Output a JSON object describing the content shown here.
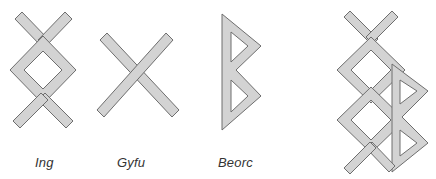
{
  "diagram": {
    "fill_color": "#d3d3d3",
    "stroke_color": "#6e6e6e",
    "label_color": "#333333",
    "runes": [
      {
        "name": "Ing",
        "label": "Ing"
      },
      {
        "name": "Gyfu",
        "label": "Gyfu"
      },
      {
        "name": "Beorc",
        "label": "Beorc"
      },
      {
        "name": "Bind-rune",
        "label": ""
      }
    ]
  }
}
